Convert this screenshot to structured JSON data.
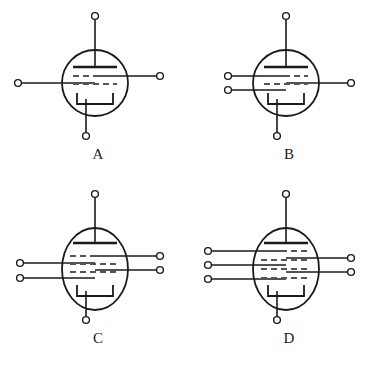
{
  "figure": {
    "kind": "vacuum-tube-symbols",
    "background_color": "#ffffff",
    "line_color": "#1a1a1a",
    "grid_dash_color": "#555555",
    "width": 382,
    "height": 369,
    "panels": [
      {
        "id": "A",
        "label": "A",
        "tube_name": "triode",
        "envelope": {
          "shape": "circle",
          "cx": 95,
          "cy": 83,
          "rx": 33,
          "ry": 33
        },
        "plate": {
          "y": 67,
          "x1": 73,
          "x2": 117
        },
        "plate_lead_top": {
          "x": 95,
          "y_from": 67,
          "y_to": 18
        },
        "grid_rows": 2,
        "cathode": {
          "x1": 77,
          "x2": 113,
          "y_top": 93,
          "y_bottom": 104
        },
        "cathode_lead_bottom": {
          "x": 86,
          "y_from": 99,
          "y_to": 134
        },
        "left_terminals": [
          {
            "y": 83,
            "x_end": 20
          }
        ],
        "right_terminals": [
          {
            "y": 76,
            "x_end": 160
          }
        ],
        "top_terminals": [
          {
            "x": 95,
            "y": 16
          }
        ],
        "bottom_terminals": [
          {
            "x": 86,
            "y": 136
          }
        ],
        "terminal_count": 4
      },
      {
        "id": "B",
        "label": "B",
        "tube_name": "tetrode",
        "envelope": {
          "shape": "circle",
          "cx": 286,
          "cy": 83,
          "rx": 33,
          "ry": 33
        },
        "plate": {
          "y": 67,
          "x1": 264,
          "x2": 308
        },
        "plate_lead_top": {
          "x": 286,
          "y_from": 67,
          "y_to": 18
        },
        "grid_rows": 2,
        "cathode": {
          "x1": 268,
          "x2": 304,
          "y_top": 93,
          "y_bottom": 104
        },
        "cathode_lead_bottom": {
          "x": 277,
          "y_from": 99,
          "y_to": 134
        },
        "left_terminals": [
          {
            "y": 76,
            "x_end": 228
          },
          {
            "y": 90,
            "x_end": 228
          }
        ],
        "right_terminals": [
          {
            "y": 83,
            "x_end": 351
          }
        ],
        "top_terminals": [
          {
            "x": 286,
            "y": 16
          }
        ],
        "bottom_terminals": [
          {
            "x": 277,
            "y": 136
          }
        ],
        "terminal_count": 5
      },
      {
        "id": "C",
        "label": "C",
        "tube_name": "pentode",
        "envelope": {
          "shape": "ellipse",
          "cx": 95,
          "cy": 269,
          "rx": 33,
          "ry": 41
        },
        "plate": {
          "y": 243,
          "x1": 73,
          "x2": 117
        },
        "plate_lead_top": {
          "x": 95,
          "y_from": 243,
          "y_to": 196
        },
        "grid_rows": 3,
        "cathode": {
          "x1": 77,
          "x2": 113,
          "y_top": 285,
          "y_bottom": 296
        },
        "cathode_lead_bottom": {
          "x": 86,
          "y_from": 291,
          "y_to": 318
        },
        "left_terminals": [
          {
            "y": 263,
            "x_end": 20
          },
          {
            "y": 278,
            "x_end": 20
          }
        ],
        "right_terminals": [
          {
            "y": 256,
            "x_end": 160
          },
          {
            "y": 270,
            "x_end": 160
          }
        ],
        "top_terminals": [
          {
            "x": 95,
            "y": 194
          }
        ],
        "bottom_terminals": [
          {
            "x": 86,
            "y": 320
          }
        ],
        "terminal_count": 6
      },
      {
        "id": "D",
        "label": "D",
        "tube_name": "hexode",
        "envelope": {
          "shape": "ellipse",
          "cx": 286,
          "cy": 269,
          "rx": 33,
          "ry": 41
        },
        "plate": {
          "y": 243,
          "x1": 264,
          "x2": 308
        },
        "plate_lead_top": {
          "x": 286,
          "y_from": 243,
          "y_to": 196
        },
        "grid_rows": 4,
        "cathode": {
          "x1": 268,
          "x2": 304,
          "y_top": 285,
          "y_bottom": 296
        },
        "cathode_lead_bottom": {
          "x": 277,
          "y_from": 291,
          "y_to": 318
        },
        "left_terminals": [
          {
            "y": 251,
            "x_end": 208
          },
          {
            "y": 265,
            "x_end": 208
          },
          {
            "y": 279,
            "x_end": 208
          }
        ],
        "right_terminals": [
          {
            "y": 258,
            "x_end": 351
          },
          {
            "y": 272,
            "x_end": 351
          }
        ],
        "top_terminals": [
          {
            "x": 286,
            "y": 194
          }
        ],
        "bottom_terminals": [
          {
            "x": 277,
            "y": 320
          }
        ],
        "terminal_count": 7
      }
    ],
    "labels": {
      "A": "A",
      "B": "B",
      "C": "C",
      "D": "D"
    }
  }
}
